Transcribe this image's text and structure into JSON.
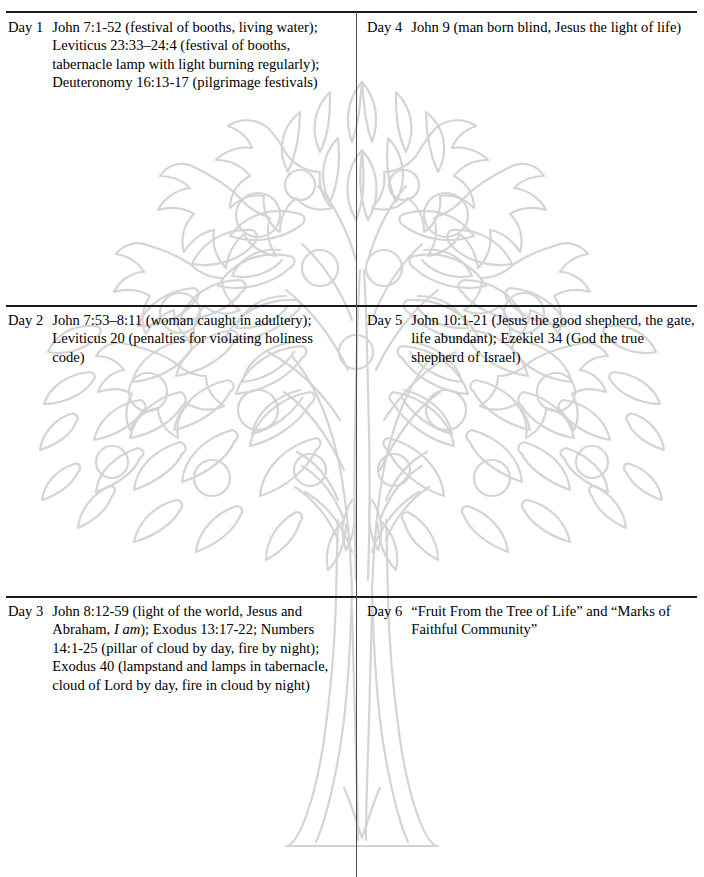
{
  "page": {
    "background_color": "#ffffff",
    "text_color": "#000000",
    "rule_color": "#1a1a1a",
    "divider_color": "#4a4a4a",
    "watermark_color": "#d4d4d4"
  },
  "watermark": {
    "name": "tree-of-life-outline",
    "description": "Light gray outline drawing of a tree with leafy canopy, round fruits, branching trunk and flared base"
  },
  "entries": [
    {
      "id": "day1",
      "column": "left",
      "day_label": "Day 1",
      "text_runs": [
        {
          "style": "normal",
          "text": "John 7:1-52 (festival of booths, living water); Leviticus 23:33–24:4 (festival of booths, tabernacle lamp with light burning regularly); Deuteronomy 16:13-17 (pilgrimage festivals)"
        }
      ]
    },
    {
      "id": "day2",
      "column": "left",
      "day_label": "Day 2",
      "text_runs": [
        {
          "style": "normal",
          "text": "John 7:53–8:11 (woman caught in adultery); Leviticus 20 (penalties for violating holiness code)"
        }
      ]
    },
    {
      "id": "day3",
      "column": "left",
      "day_label": "Day 3",
      "text_runs": [
        {
          "style": "normal",
          "text": "John 8:12-59 (light of the world, Jesus and Abraham, "
        },
        {
          "style": "italic",
          "text": "I am"
        },
        {
          "style": "normal",
          "text": "); Exodus 13:17-22; Numbers 14:1-25 (pillar of cloud by day, fire by night); Exodus 40 (lampstand and lamps in tabernacle, cloud of Lord by day, fire in cloud by night)"
        }
      ]
    },
    {
      "id": "day4",
      "column": "right",
      "day_label": "Day 4",
      "text_runs": [
        {
          "style": "normal",
          "text": "John 9 (man born blind, Jesus the light of life)"
        }
      ]
    },
    {
      "id": "day5",
      "column": "right",
      "day_label": "Day 5",
      "text_runs": [
        {
          "style": "normal",
          "text": "John 10:1-21 (Jesus the good shepherd, the gate, life abundant); Ezekiel 34 (God the true shepherd of Israel)"
        }
      ]
    },
    {
      "id": "day6",
      "column": "right",
      "day_label": "Day 6",
      "text_runs": [
        {
          "style": "normal",
          "text": "“Fruit From the Tree of Life” and “Marks of Faithful Community”"
        }
      ]
    }
  ]
}
